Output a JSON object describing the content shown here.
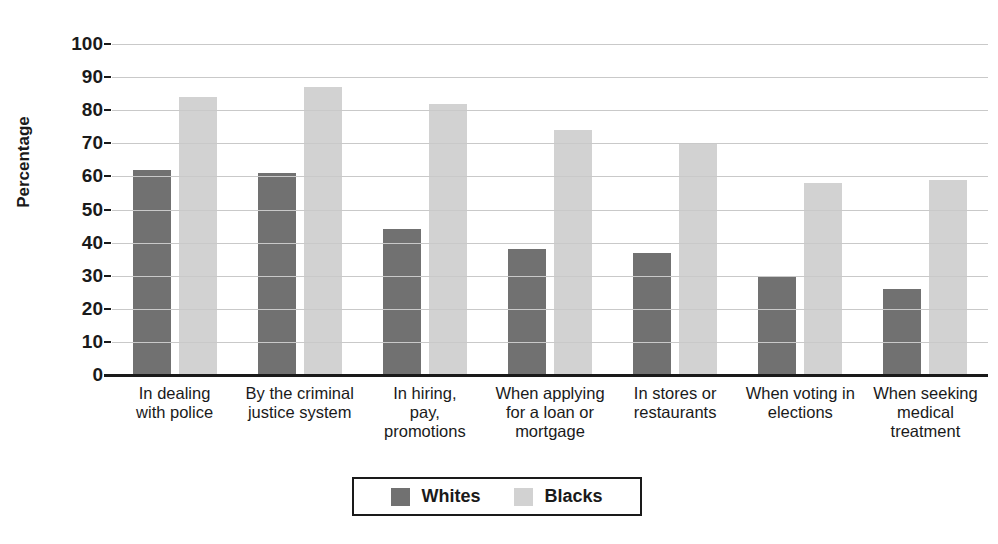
{
  "chart_data": {
    "type": "bar",
    "title": "",
    "xlabel": "",
    "ylabel": "Percentage",
    "ylim": [
      0,
      100
    ],
    "ytick_step": 10,
    "yticks": [
      100,
      90,
      80,
      70,
      60,
      50,
      40,
      30,
      20,
      10,
      0
    ],
    "grid": true,
    "legend_position": "bottom-center",
    "categories": [
      "In dealing\nwith police",
      "By the criminal\njustice system",
      "In hiring,\npay,\npromotions",
      "When applying\nfor a loan or\nmortgage",
      "In stores or\nrestaurants",
      "When voting in\nelections",
      "When seeking\nmedical\ntreatment"
    ],
    "series": [
      {
        "name": "Whites",
        "color": "#717171",
        "values": [
          62,
          61,
          44,
          38,
          37,
          30,
          26
        ]
      },
      {
        "name": "Blacks",
        "color": "#d2d2d2",
        "values": [
          84,
          87,
          82,
          74,
          70,
          58,
          59
        ]
      }
    ]
  },
  "axis": {
    "y_title": "Percentage"
  },
  "legend": {
    "items": [
      {
        "label": "Whites",
        "color": "#717171"
      },
      {
        "label": "Blacks",
        "color": "#d2d2d2"
      }
    ]
  },
  "footer": {
    "caption": ""
  }
}
